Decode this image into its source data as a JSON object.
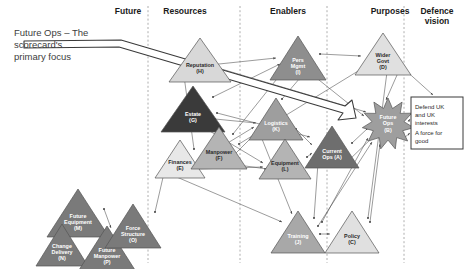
{
  "title_callout": {
    "lines": [
      "Future Ops – The",
      "scorecard's",
      "primary focus"
    ]
  },
  "columns": [
    {
      "id": "future",
      "label": "Future",
      "x": 128
    },
    {
      "id": "resources",
      "label": "Resources",
      "x": 185
    },
    {
      "id": "enablers",
      "label": "Enablers",
      "x": 288
    },
    {
      "id": "purposes",
      "label": "Purposes",
      "x": 390
    },
    {
      "id": "defence",
      "label": "Defence vision",
      "x": 437,
      "line1": "Defence",
      "line2": "vision"
    }
  ],
  "dividers": [
    148,
    240,
    327,
    404
  ],
  "colors": {
    "very_dark": "#3a3a3a",
    "dark": "#6e6e6e",
    "mid": "#8e8e8e",
    "light_mid": "#b4b4b4",
    "light": "#d8d8d8",
    "very_light": "#e8e8e8",
    "stroke": "#555555",
    "divider": "#9a9a9a",
    "banner_fill": "#ffffff",
    "banner_stroke": "#3a3a3a"
  },
  "nodes": [
    {
      "id": "reputation",
      "line1": "Reputation",
      "line2": "(H)",
      "cx": 200,
      "cy": 60,
      "w": 62,
      "h": 44,
      "fill": "#d8d8d8",
      "text": "light"
    },
    {
      "id": "estate",
      "line1": "Estate",
      "line2": "(G)",
      "cx": 193,
      "cy": 109,
      "w": 64,
      "h": 46,
      "fill": "#3a3a3a",
      "text": "dark"
    },
    {
      "id": "finances",
      "line1": "Finances",
      "line2": "(E)",
      "cx": 180,
      "cy": 159,
      "w": 50,
      "h": 38,
      "fill": "#e8e8e8",
      "text": "light"
    },
    {
      "id": "manpower",
      "line1": "Manpower",
      "line2": "(F)",
      "cx": 219,
      "cy": 148,
      "w": 56,
      "h": 42,
      "fill": "#b4b4b4",
      "text": "light"
    },
    {
      "id": "persmgmt",
      "line1": "Pers",
      "line2": "Mgmt",
      "line3": "(I)",
      "cx": 298,
      "cy": 58,
      "w": 56,
      "h": 44,
      "fill": "#8e8e8e",
      "text": "dark"
    },
    {
      "id": "logistics",
      "line1": "Logistics",
      "line2": "(K)",
      "cx": 276,
      "cy": 119,
      "w": 54,
      "h": 42,
      "fill": "#9e9e9e",
      "text": "dark"
    },
    {
      "id": "equipment",
      "line1": "Equipment",
      "line2": "(L)",
      "cx": 285,
      "cy": 159,
      "w": 52,
      "h": 40,
      "fill": "#b4b4b4",
      "text": "light"
    },
    {
      "id": "currentops",
      "line1": "Current",
      "line2": "Ops (A)",
      "cx": 332,
      "cy": 147,
      "w": 54,
      "h": 42,
      "fill": "#6e6e6e",
      "text": "dark"
    },
    {
      "id": "widergovt",
      "line1": "Wider",
      "line2": "Govt",
      "line3": "(D)",
      "cx": 383,
      "cy": 54,
      "w": 56,
      "h": 42,
      "fill": "#e0e0e0",
      "text": "light"
    },
    {
      "id": "training",
      "line1": "Training",
      "line2": "(J)",
      "cx": 298,
      "cy": 232,
      "w": 54,
      "h": 42,
      "fill": "#a8a8a8",
      "text": "dark"
    },
    {
      "id": "policy",
      "line1": "Policy",
      "line2": "(C)",
      "cx": 352,
      "cy": 232,
      "w": 54,
      "h": 42,
      "fill": "#e0e0e0",
      "text": "light"
    },
    {
      "id": "futureequipment",
      "line1": "Future",
      "line2": "Equipment",
      "line3": "(M)",
      "cx": 78,
      "cy": 213,
      "w": 62,
      "h": 48,
      "fill": "#7a7a7a",
      "text": "dark"
    },
    {
      "id": "changedelivery",
      "line1": "Change",
      "line2": "Delivery",
      "line3": "(N)",
      "cx": 62,
      "cy": 245,
      "w": 52,
      "h": 42,
      "fill": "#7a7a7a",
      "text": "dark"
    },
    {
      "id": "futuremanpower",
      "line1": "Future",
      "line2": "Manpower",
      "line3": "(P)",
      "cx": 107,
      "cy": 248,
      "w": 56,
      "h": 44,
      "fill": "#7a7a7a",
      "text": "dark"
    },
    {
      "id": "forcestructure",
      "line1": "Force",
      "line2": "Structure",
      "line3": "(O)",
      "cx": 133,
      "cy": 226,
      "w": 56,
      "h": 44,
      "fill": "#7a7a7a",
      "text": "dark"
    }
  ],
  "future_ops": {
    "id": "futureops",
    "line1": "Future",
    "line2": "Ops",
    "line3": "(B)",
    "cx": 388,
    "cy": 124,
    "r": 26,
    "fill": "#9e9e9e",
    "text": "dark"
  },
  "vision_box": {
    "x": 411,
    "y": 97,
    "w": 52,
    "h": 52,
    "para1": "Defend UK and UK interests",
    "para2": "A force for good",
    "lines": [
      "Defend UK",
      "and UK",
      "interests",
      "A force for",
      "good"
    ]
  },
  "edges_count": 34
}
